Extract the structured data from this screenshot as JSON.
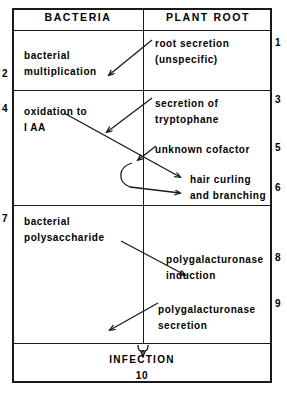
{
  "figure": {
    "type": "flow-diagram",
    "columns": {
      "left_header": "BACTERIA",
      "right_header": "PLANT ROOT"
    },
    "steps": [
      {
        "number": "1",
        "column": "right",
        "label": "root secretion\n(unspecific)"
      },
      {
        "number": "2",
        "column": "left",
        "label": "bacterial\nmultiplication"
      },
      {
        "number": "3",
        "column": "right",
        "label": "secretion of\ntryptophane"
      },
      {
        "number": "4",
        "column": "left",
        "label": "oxidation to\nIAA"
      },
      {
        "number": "5",
        "column": "right",
        "label": "unknown  cofactor"
      },
      {
        "number": "6",
        "column": "right",
        "label": "hair curling\nand  branching"
      },
      {
        "number": "7",
        "column": "left",
        "label": "bacterial\npolysaccharide"
      },
      {
        "number": "8",
        "column": "right",
        "label": "polygalacturonase\ninduction"
      },
      {
        "number": "9",
        "column": "right",
        "label": "polygalacturonase\nsecretion"
      },
      {
        "number": "10",
        "column": "center",
        "label": "INFECTION"
      }
    ],
    "numbers": {
      "n1": "1",
      "n2": "2",
      "n3": "3",
      "n4": "4",
      "n5": "5",
      "n6": "6",
      "n7": "7",
      "n8": "8",
      "n9": "9",
      "n10": "10"
    },
    "labels": {
      "bacterial_multiplication": "bacterial\nmultiplication",
      "oxidation_to_iaa": "oxidation to\nI AA",
      "bacterial_polysaccharide": "bacterial\npolysaccharide",
      "root_secretion": "root  secretion\n(unspecific)",
      "secretion_of_tryptophane": "secretion  of\ntryptophane",
      "unknown_cofactor": "unknown  cofactor",
      "hair_curling": "hair  curling\nand  branching",
      "polygalacturonase_induction": "polygalacturonase\ninduction",
      "polygalacturonase_secretion": "polygalacturonase\nsecretion",
      "infection": "INFECTION",
      "infection_number": "10"
    },
    "colors": {
      "ink": "#1a1a1a",
      "paper": "#ffffff"
    }
  }
}
